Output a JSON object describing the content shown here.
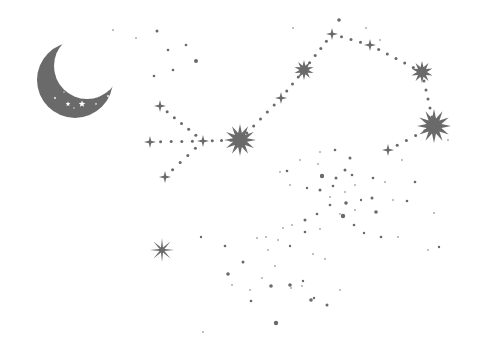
{
  "scene": {
    "title": "Constellation with crescent moon",
    "background": "#ffffff",
    "ink": "#6a6a6a"
  },
  "moon": {
    "cx": 75,
    "cy": 80,
    "r": 38,
    "cut_dx": 12,
    "cut_dy": -14,
    "cut_r": 33
  },
  "constellation_stars": [
    {
      "name": "burst-large-center",
      "x": 240,
      "y": 140,
      "r": 16,
      "points": 12
    },
    {
      "name": "burst-large-right",
      "x": 434,
      "y": 126,
      "r": 17,
      "points": 12
    },
    {
      "name": "burst-upper-mid",
      "x": 304,
      "y": 70,
      "r": 10,
      "points": 10
    },
    {
      "name": "burst-upper-right",
      "x": 422,
      "y": 72,
      "r": 11,
      "points": 10
    },
    {
      "name": "sparkle-top",
      "x": 332,
      "y": 34,
      "r": 6,
      "points": 4
    },
    {
      "name": "sparkle-top-right",
      "x": 370,
      "y": 45,
      "r": 6,
      "points": 4
    },
    {
      "name": "sparkle-mid-path",
      "x": 281,
      "y": 98,
      "r": 6,
      "points": 4
    },
    {
      "name": "sparkle-right-low",
      "x": 388,
      "y": 150,
      "r": 6,
      "points": 4
    },
    {
      "name": "sparkle-left-top",
      "x": 160,
      "y": 106,
      "r": 6,
      "points": 4
    },
    {
      "name": "sparkle-left",
      "x": 150,
      "y": 142,
      "r": 6,
      "points": 4
    },
    {
      "name": "sparkle-left-mid",
      "x": 203,
      "y": 141,
      "r": 6,
      "points": 4
    },
    {
      "name": "sparkle-left-bottom",
      "x": 165,
      "y": 177,
      "r": 6,
      "points": 4
    },
    {
      "name": "sparkle-lone",
      "x": 162,
      "y": 250,
      "r": 12,
      "points": 8
    }
  ],
  "dotted_paths": [
    [
      [
        150,
        142
      ],
      [
        203,
        141
      ],
      [
        240,
        140
      ]
    ],
    [
      [
        160,
        106
      ],
      [
        203,
        141
      ]
    ],
    [
      [
        165,
        177
      ],
      [
        203,
        141
      ]
    ],
    [
      [
        240,
        140
      ],
      [
        281,
        98
      ],
      [
        304,
        70
      ],
      [
        332,
        34
      ]
    ],
    [
      [
        332,
        34
      ],
      [
        370,
        45
      ],
      [
        422,
        72
      ]
    ],
    [
      [
        422,
        72
      ],
      [
        434,
        126
      ]
    ],
    [
      [
        434,
        126
      ],
      [
        388,
        150
      ]
    ]
  ],
  "scatter_dots": [
    [
      157,
      31,
      1.5
    ],
    [
      186,
      45,
      1.3
    ],
    [
      168,
      50,
      1.3
    ],
    [
      196,
      61,
      2
    ],
    [
      173,
      70,
      1.3
    ],
    [
      154,
      76,
      1.3
    ],
    [
      136,
      38,
      1
    ],
    [
      113,
      30,
      1
    ],
    [
      293,
      28,
      1
    ],
    [
      339,
      20,
      1.8
    ],
    [
      366,
      28,
      1
    ],
    [
      380,
      40,
      1
    ],
    [
      448,
      140,
      1
    ],
    [
      300,
      160,
      1
    ],
    [
      287,
      171,
      1.3
    ],
    [
      320,
      152,
      1
    ],
    [
      335,
      150,
      1.3
    ],
    [
      350,
      158,
      1.5
    ],
    [
      318,
      164,
      1
    ],
    [
      345,
      170,
      1.5
    ],
    [
      322,
      176,
      2.2
    ],
    [
      336,
      178,
      1.5
    ],
    [
      352,
      175,
      1.3
    ],
    [
      280,
      172,
      1
    ],
    [
      290,
      185,
      1
    ],
    [
      307,
      188,
      1.2
    ],
    [
      320,
      190,
      1.5
    ],
    [
      333,
      186,
      1.3
    ],
    [
      345,
      192,
      1
    ],
    [
      355,
      185,
      1
    ],
    [
      373,
      178,
      1.3
    ],
    [
      385,
      182,
      1
    ],
    [
      402,
      160,
      1
    ],
    [
      415,
      182,
      1.3
    ],
    [
      330,
      197,
      1
    ],
    [
      346,
      203,
      1.8
    ],
    [
      361,
      200,
      1.2
    ],
    [
      372,
      198,
      1.5
    ],
    [
      376,
      212,
      1.8
    ],
    [
      355,
      210,
      1
    ],
    [
      340,
      214,
      1
    ],
    [
      330,
      205,
      1.3
    ],
    [
      317,
      214,
      1.3
    ],
    [
      305,
      220,
      1.5
    ],
    [
      292,
      225,
      1
    ],
    [
      305,
      232,
      1.3
    ],
    [
      320,
      229,
      1
    ],
    [
      343,
      216,
      2.2
    ],
    [
      354,
      225,
      1.3
    ],
    [
      364,
      233,
      1.2
    ],
    [
      393,
      200,
      1
    ],
    [
      407,
      201,
      1.3
    ],
    [
      434,
      213,
      1
    ],
    [
      439,
      247,
      1.2
    ],
    [
      428,
      250,
      1
    ],
    [
      398,
      237,
      1
    ],
    [
      381,
      237,
      1.3
    ],
    [
      283,
      228,
      1
    ],
    [
      278,
      240,
      1
    ],
    [
      268,
      250,
      1
    ],
    [
      266,
      237,
      1
    ],
    [
      257,
      238,
      1
    ],
    [
      290,
      246,
      1.2
    ],
    [
      313,
      254,
      1
    ],
    [
      325,
      259,
      1
    ],
    [
      201,
      237,
      1.2
    ],
    [
      225,
      246,
      1.3
    ],
    [
      243,
      262,
      1.5
    ],
    [
      228,
      274,
      1.8
    ],
    [
      262,
      278,
      1
    ],
    [
      250,
      290,
      1
    ],
    [
      271,
      286,
      1.8
    ],
    [
      291,
      288,
      1
    ],
    [
      303,
      281,
      1.2
    ],
    [
      302,
      286,
      1
    ],
    [
      314,
      298,
      1.2
    ],
    [
      327,
      305,
      1.5
    ],
    [
      311,
      300,
      1.8
    ],
    [
      276,
      323,
      2.2
    ],
    [
      251,
      301,
      1.3
    ],
    [
      290,
      285,
      1.8
    ],
    [
      340,
      290,
      1
    ],
    [
      275,
      266,
      1
    ],
    [
      232,
      285,
      1
    ],
    [
      203,
      332,
      1
    ]
  ],
  "moon_stars": [
    [
      95,
      94,
      4.5
    ],
    [
      82,
      104,
      3.5
    ],
    [
      101,
      78,
      3
    ],
    [
      68,
      104,
      2.5
    ],
    [
      55,
      98,
      1.5
    ],
    [
      102,
      62,
      1.5
    ],
    [
      108,
      96,
      1.5
    ],
    [
      90,
      70,
      1.2
    ],
    [
      96,
      104,
      1.2
    ],
    [
      107,
      85,
      1.2
    ],
    [
      64,
      92,
      1
    ],
    [
      74,
      108,
      1
    ]
  ]
}
